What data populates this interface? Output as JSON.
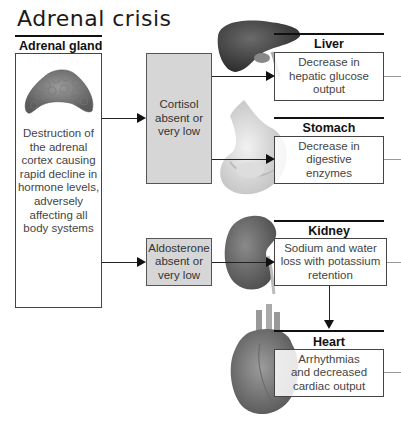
{
  "title": "Adrenal crisis",
  "adrenal_gland": {
    "label": "Adrenal gland",
    "description": "Destruction of the adrenal cortex causing rapid decline in hormone levels, adversely affecting all body systems"
  },
  "hormones": [
    {
      "label": "Cortisol absent or very low"
    },
    {
      "label": "Aldosterone absent or very low"
    }
  ],
  "organs": [
    {
      "name": "Liver",
      "effect": "Decrease in hepatic glucose output"
    },
    {
      "name": "Stomach",
      "effect": "Decrease in digestive enzymes"
    },
    {
      "name": "Kidney",
      "effect": "Sodium and water loss with potassium retention"
    },
    {
      "name": "Heart",
      "effect": "Arrhythmias and decreased cardiac output"
    }
  ],
  "colors": {
    "hormone_box_fill": "#d6d6d6",
    "line": "#111111"
  }
}
